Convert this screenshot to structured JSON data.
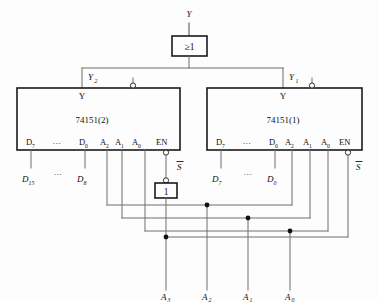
{
  "diagram": {
    "type": "logic-schematic"
  },
  "output": {
    "label": "Y",
    "or_gate": {
      "symbol": "≥1",
      "name": "or-gate"
    }
  },
  "chips": [
    {
      "id": "mux2",
      "name": "74151(2)",
      "y_label": "Y",
      "y_signal": "Y",
      "y_signal_sub": "2",
      "pins": [
        "D",
        "…",
        "D",
        "A",
        "A",
        "A",
        "EN"
      ],
      "pin_labels": [
        {
          "base": "D",
          "sub": "7"
        },
        {
          "base": "…",
          "sub": ""
        },
        {
          "base": "D",
          "sub": "0"
        },
        {
          "base": "A",
          "sub": "2"
        },
        {
          "base": "A",
          "sub": "1"
        },
        {
          "base": "A",
          "sub": "0"
        },
        {
          "base": "EN",
          "sub": ""
        }
      ],
      "data_inputs": [
        {
          "base": "D",
          "sub": "15"
        },
        {
          "base": "…",
          "sub": ""
        },
        {
          "base": "D",
          "sub": "8"
        }
      ],
      "enable_label": "S",
      "enable_overbar": true
    },
    {
      "id": "mux1",
      "name": "74151(1)",
      "y_label": "Y",
      "y_signal": "Y",
      "y_signal_sub": "1",
      "pin_labels": [
        {
          "base": "D",
          "sub": "7"
        },
        {
          "base": "…",
          "sub": ""
        },
        {
          "base": "D",
          "sub": "0"
        },
        {
          "base": "A",
          "sub": "2"
        },
        {
          "base": "A",
          "sub": "1"
        },
        {
          "base": "A",
          "sub": "0"
        },
        {
          "base": "EN",
          "sub": ""
        }
      ],
      "data_inputs": [
        {
          "base": "D",
          "sub": "7"
        },
        {
          "base": "…",
          "sub": ""
        },
        {
          "base": "D",
          "sub": "0"
        }
      ],
      "enable_label": "S",
      "enable_overbar": true
    }
  ],
  "inverter": {
    "symbol": "1",
    "name": "inverter-gate"
  },
  "address_inputs": [
    {
      "base": "A",
      "sub": "3"
    },
    {
      "base": "A",
      "sub": "2"
    },
    {
      "base": "A",
      "sub": "1"
    },
    {
      "base": "A",
      "sub": "0"
    }
  ],
  "colors": {
    "wire": "#6e6e6e",
    "box": "#1a1a1a",
    "text": "#111111",
    "background": "#fdfdfd"
  }
}
